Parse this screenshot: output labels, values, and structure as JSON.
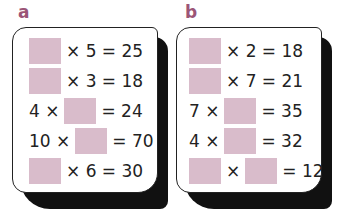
{
  "panels": [
    {
      "label": "a",
      "rows": [
        {
          "pre": "",
          "mid": "× 5 = 25"
        },
        {
          "pre": "",
          "mid": "× 3 = 18"
        },
        {
          "pre": "4 ×",
          "post": "= 24"
        },
        {
          "pre": "10 ×",
          "post": "= 70"
        },
        {
          "pre": "",
          "mid": "× 6 = 30"
        }
      ]
    },
    {
      "label": "b",
      "rows": [
        {
          "pre": "",
          "mid": "× 2 = 18"
        },
        {
          "pre": "",
          "mid": "× 7 = 21"
        },
        {
          "pre": "7 ×",
          "post": "= 35"
        },
        {
          "pre": "4 ×",
          "post": "= 32"
        },
        {
          "mid": "×",
          "post": "= 12"
        }
      ]
    }
  ],
  "colors": {
    "blank_box": "#d9bccb",
    "label": "#9b5577"
  }
}
